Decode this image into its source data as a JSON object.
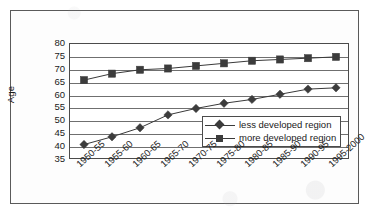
{
  "chart_data": {
    "type": "line",
    "title": "",
    "xlabel": "",
    "ylabel": "Age",
    "ylim": [
      35,
      80
    ],
    "ytick_step": 5,
    "yticks": [
      80,
      75,
      70,
      65,
      60,
      55,
      50,
      45,
      40,
      35
    ],
    "grid": true,
    "legend_position": "inside-lower-right",
    "categories": [
      "1950-55",
      "1955-60",
      "1960-65",
      "1965-70",
      "1970-75",
      "1975-80",
      "1980-85",
      "1985-90",
      "1990-95",
      "1995-2000"
    ],
    "series": [
      {
        "name": "less developed region",
        "marker": "diamond",
        "values": [
          41,
          44,
          47.5,
          52.5,
          55,
          57,
          58.5,
          60.5,
          62.5,
          63
        ]
      },
      {
        "name": "more developed region",
        "marker": "square",
        "values": [
          66,
          68.5,
          70,
          70.5,
          71.5,
          72.5,
          73.5,
          74,
          74.5,
          75
        ]
      }
    ],
    "colors": {
      "series_line": "#3a3a3a",
      "marker": "#3c3c3c",
      "gridline": "#6f6f6f",
      "axis": "#4b4b4b",
      "frame": "#5a5a5a",
      "text": "#1a1a1a",
      "background": "#ffffff"
    }
  },
  "legend": {
    "items": [
      {
        "label": "less developed region",
        "marker": "diamond"
      },
      {
        "label": "more developed region",
        "marker": "square"
      }
    ]
  }
}
